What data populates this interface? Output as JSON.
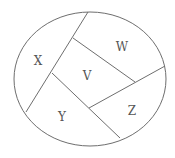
{
  "diagram": {
    "type": "region-map",
    "outline": {
      "shape": "ellipse",
      "cx": 90,
      "cy": 79,
      "rx": 76,
      "ry": 67
    },
    "dividers": [
      {
        "x1": 88,
        "y1": 12,
        "x2": 26,
        "y2": 112
      },
      {
        "x1": 73,
        "y1": 38,
        "x2": 135,
        "y2": 82
      },
      {
        "x1": 52,
        "y1": 73,
        "x2": 120,
        "y2": 138
      },
      {
        "x1": 89,
        "y1": 108,
        "x2": 165,
        "y2": 66
      }
    ],
    "regions": [
      {
        "label": "X",
        "x": 38,
        "y": 61
      },
      {
        "label": "W",
        "x": 122,
        "y": 47
      },
      {
        "label": "V",
        "x": 87,
        "y": 76
      },
      {
        "label": "Y",
        "x": 62,
        "y": 117
      },
      {
        "label": "Z",
        "x": 132,
        "y": 111
      }
    ],
    "colors": {
      "stroke": "#6e6e6e",
      "text": "#555555",
      "background": "#ffffff"
    }
  }
}
